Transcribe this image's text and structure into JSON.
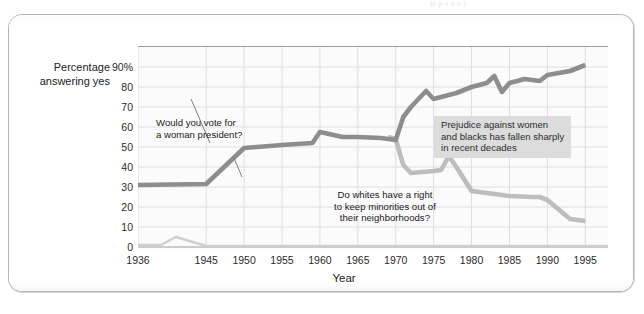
{
  "top_sliver_text": "to p   n         n    n        )",
  "axes": {
    "y_title_line1": "Percentage",
    "y_title_line2": "answering yes",
    "x_title": "Year",
    "y_ticks": [
      "90%",
      "80",
      "70",
      "60",
      "50",
      "40",
      "30",
      "20",
      "10",
      "0"
    ],
    "y_tick_values": [
      90,
      80,
      70,
      60,
      50,
      40,
      30,
      20,
      10,
      0
    ],
    "x_ticks": [
      "1936",
      "1945",
      "1950",
      "1955",
      "1960",
      "1965",
      "1970",
      "1975",
      "1980",
      "1985",
      "1990",
      "1995"
    ],
    "x_tick_values": [
      1936,
      1945,
      1950,
      1955,
      1960,
      1965,
      1970,
      1975,
      1980,
      1985,
      1990,
      1995
    ]
  },
  "annotations": {
    "woman_president": "Would you vote for\na woman president?",
    "woman_president_l1": "Would you vote for",
    "woman_president_l2": "a woman president?",
    "whites_right": "Do whites have a right\nto keep minorities out of\ntheir neighborhoods?",
    "whites_right_l1": "Do whites have a right",
    "whites_right_l2": "to keep minorities out of",
    "whites_right_l3": "their neighborhoods?",
    "prejudice_l1": "Prejudice against women",
    "prejudice_l2": "and blacks has fallen sharply",
    "prejudice_l3": "in recent decades"
  },
  "colors": {
    "series_woman_president": "#8d8d8d",
    "series_whites_right": "#bdbdbd",
    "baseline_artifact": "#cfcfcf",
    "gridline": "#dedede",
    "axis": "#9b9b9b",
    "plot_background": "#fbfbfb",
    "card_border": "#b4b4b4",
    "annotation_highlight": "#dcdcdc",
    "text": "#1c1c1c"
  },
  "chart_data": {
    "type": "line",
    "title": "",
    "xlabel": "Year",
    "ylabel": "Percentage answering yes",
    "xlim": [
      1936,
      1998
    ],
    "ylim": [
      0,
      100
    ],
    "grid": true,
    "legend": "none (series labeled by in-plot annotations)",
    "series": [
      {
        "name": "Would you vote for a woman president?",
        "color": "#8d8d8d",
        "x": [
          1936,
          1945,
          1950,
          1955,
          1959,
          1960,
          1963,
          1965,
          1968,
          1969,
          1970,
          1971,
          1972,
          1974,
          1975,
          1977,
          1978,
          1980,
          1982,
          1983,
          1984,
          1985,
          1987,
          1989,
          1990,
          1993,
          1995
        ],
        "values": [
          31,
          31.5,
          49.5,
          51,
          52,
          57.5,
          55,
          55,
          54.5,
          54,
          53.5,
          65,
          70,
          78,
          74,
          76,
          77,
          80,
          82,
          85.5,
          77.5,
          82,
          84,
          83,
          86,
          88,
          91
        ]
      },
      {
        "name": "Do whites have a right to keep minorities out of their neighborhoods?",
        "color": "#bdbdbd",
        "x": [
          1969,
          1970,
          1971,
          1972,
          1975,
          1976,
          1977,
          1978,
          1980,
          1982,
          1985,
          1988,
          1989,
          1990,
          1993,
          1995
        ],
        "values": [
          55,
          54,
          41,
          37,
          38,
          38.5,
          45.5,
          40,
          28,
          27,
          25.5,
          25,
          25,
          23.5,
          14,
          13
        ]
      }
    ],
    "baseline_artifact": {
      "name": "low flat baseline trace near 0%",
      "color": "#cfcfcf",
      "x": [
        1936,
        1939,
        1941,
        1945,
        1998
      ],
      "values": [
        1,
        1,
        5,
        0.5,
        0.5
      ]
    }
  }
}
